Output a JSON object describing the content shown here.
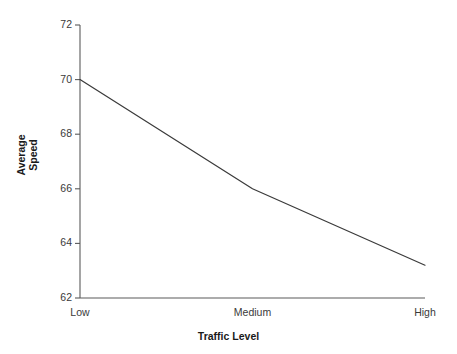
{
  "chart_data": {
    "type": "line",
    "title": "",
    "subtitle": "",
    "xlabel": "Traffic Level",
    "ylabel": "Average Speed",
    "categories": [
      "Low",
      "Medium",
      "High"
    ],
    "values": [
      70.0,
      66.0,
      63.2
    ],
    "series": [
      {
        "name": "Average Speed",
        "values": [
          70.0,
          66.0,
          63.2
        ]
      }
    ],
    "ylim": [
      62,
      72
    ],
    "yticks": [
      62,
      64,
      66,
      68,
      70,
      72
    ],
    "ytick_labels": [
      "62",
      "64",
      "66",
      "68",
      "70",
      "72"
    ],
    "xtick_labels": [
      "Low",
      "Medium",
      "High"
    ],
    "grid": false,
    "legend": false,
    "legend_position": "none",
    "line_color": "#3a3a3a",
    "axis_color": "#5a5a5a",
    "background_color": "#ffffff",
    "markers": false,
    "annotations": []
  },
  "axis": {
    "y_title_line1": "Average",
    "y_title_line2": "Speed",
    "x_title": "Traffic Level"
  }
}
